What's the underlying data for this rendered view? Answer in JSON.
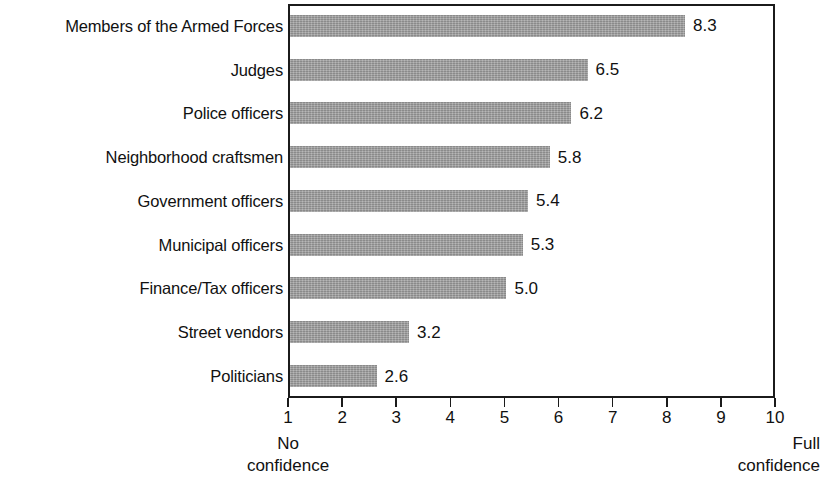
{
  "chart_data": {
    "type": "bar",
    "orientation": "horizontal",
    "title": "",
    "xlabel": "",
    "ylabel": "",
    "xlim": [
      1,
      10
    ],
    "grid": false,
    "legend": false,
    "axis_endpoint_labels": {
      "low": "No\nconfidence",
      "low_line1": "No",
      "low_line2": "confidence",
      "high": "Full\nconfidence",
      "high_line1": "Full",
      "high_line2": "confidence"
    },
    "xticks": [
      "1",
      "2",
      "3",
      "4",
      "5",
      "6",
      "7",
      "8",
      "9",
      "10"
    ],
    "categories": [
      "Members of the Armed Forces",
      "Judges",
      "Police officers",
      "Neighborhood craftsmen",
      "Government officers",
      "Municipal officers",
      "Finance/Tax officers",
      "Street vendors",
      "Politicians"
    ],
    "values": [
      8.3,
      6.5,
      6.2,
      5.8,
      5.4,
      5.3,
      5.0,
      3.2,
      2.6
    ],
    "value_labels": [
      "8.3",
      "6.5",
      "6.2",
      "5.8",
      "5.4",
      "5.3",
      "5.0",
      "3.2",
      "2.6"
    ],
    "bar_color": "#9b9b9b",
    "frame_color": "#1b1b1b",
    "text_color": "#111111"
  }
}
